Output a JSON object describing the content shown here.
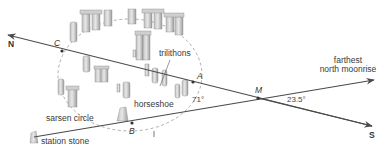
{
  "diagram": {
    "title": "",
    "directions": {
      "north": "N",
      "south": "S"
    },
    "points": {
      "A": "A",
      "B": "B",
      "C": "C",
      "M": "M"
    },
    "angles": {
      "angle_at_A_side": "71°",
      "angle_at_M": "23.5°"
    },
    "labels": {
      "trilithons": "trilithons",
      "horseshoe": "horseshoe",
      "sarsen_circle": "sarsen circle",
      "station_stone": "station stone",
      "moonrise_line1": "farthest",
      "moonrise_line2": "north moonrise"
    },
    "colors": {
      "line": "#4a4a4a",
      "stone_fill": "#d9d9d9",
      "stone_shade": "#a8a8a8",
      "dashed_circle": "#9a9a9a",
      "text": "#3a3a3a"
    }
  }
}
